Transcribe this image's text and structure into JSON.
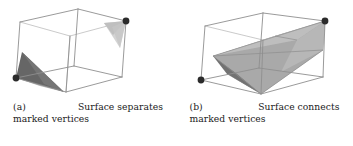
{
  "figure": {
    "type": "geometry-illustration",
    "background_color": "#ffffff",
    "edge_color": "#8c8c8c",
    "hidden_edge_color": "#b4b4b4",
    "vertex_marker_color": "#2b2b2b",
    "surface_dark_color": "#6e6e6e",
    "surface_light_color": "#c8c8c8",
    "surface_mid_color": "#a5a5a5"
  },
  "subfigures": [
    {
      "id": "a",
      "label": "(a)",
      "caption_line1": "Surface  separates",
      "caption_line2": "marked vertices",
      "caption_full": "(a) Surface separates marked vertices",
      "marked_vertex_count": 2,
      "surface_count": 2,
      "surfaces_connected": false
    },
    {
      "id": "b",
      "label": "(b)",
      "caption_line1": "Surface  connects",
      "caption_line2": "marked vertices",
      "caption_full": "(b) Surface connects marked vertices",
      "marked_vertex_count": 2,
      "surface_count": 1,
      "surfaces_connected": true
    }
  ]
}
